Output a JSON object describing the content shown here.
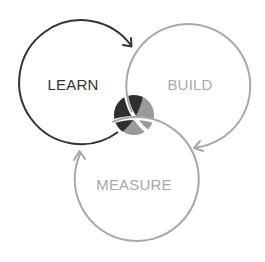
{
  "diagram": {
    "type": "cycle-venn",
    "nodes": [
      {
        "id": "learn",
        "label": "LEARN",
        "color": "#333333",
        "cx": 82,
        "cy": 85,
        "r": 62,
        "label_x": 73,
        "label_y": 90
      },
      {
        "id": "build",
        "label": "BUILD",
        "color": "#a8a8a8",
        "cx": 187,
        "cy": 84,
        "r": 62,
        "label_x": 190,
        "label_y": 90
      },
      {
        "id": "measure",
        "label": "MEASURE",
        "color": "#a8a8a8",
        "cx": 134,
        "cy": 180,
        "r": 62,
        "label_x": 134,
        "label_y": 190
      }
    ],
    "edges": [
      {
        "from": "learn",
        "to": "build",
        "arrow": true
      },
      {
        "from": "build",
        "to": "measure",
        "arrow": true
      },
      {
        "from": "measure",
        "to": "learn",
        "arrow": true
      }
    ],
    "center": {
      "dark_color": "#2f2f2f",
      "light_color": "#9a9a9a"
    }
  }
}
